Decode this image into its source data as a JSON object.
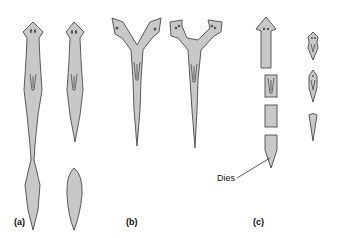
{
  "figure": {
    "panels": [
      {
        "label": "(a)",
        "description": "Planarian constricting and splitting into head and tail pieces"
      },
      {
        "label": "(b)",
        "description": "Planarian with split head regenerating two heads"
      },
      {
        "label": "(c)",
        "description": "Planarian cut into fragments; each regenerates, tip dies"
      }
    ],
    "annotations": {
      "dies": "Dies"
    },
    "colors": {
      "body_fill": "#c8c8c8",
      "outline": "#4a4a4a",
      "text": "#111111"
    }
  }
}
